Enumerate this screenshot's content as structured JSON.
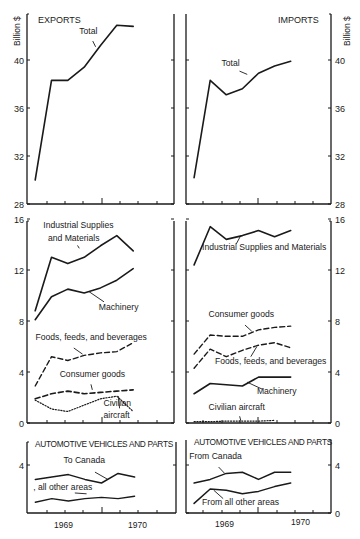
{
  "chart_data": [
    {
      "id": "exports-total",
      "type": "line",
      "panel_title": "EXPORTS",
      "ylabel": "Billion $",
      "ylim": [
        28,
        44
      ],
      "yticks": [
        28,
        32,
        36,
        40
      ],
      "x_range": [
        1968.5,
        1970.75
      ],
      "xtick_labels": [],
      "series": [
        {
          "name": "Total",
          "style": "solid",
          "width": 1.6,
          "x": [
            1968.625,
            1968.875,
            1969.125,
            1969.375,
            1969.625,
            1969.875,
            1970.125
          ],
          "y": [
            30.0,
            38.3,
            38.3,
            39.4,
            41.2,
            42.9,
            42.8
          ]
        }
      ],
      "annotations": [
        {
          "text": "Total",
          "x": 1969.3,
          "y": 42.2,
          "arrow_to": [
            1969.55,
            41.1
          ]
        }
      ]
    },
    {
      "id": "imports-total",
      "type": "line",
      "panel_title": "IMPORTS",
      "ylabel": "Billion $",
      "ylim": [
        28,
        44
      ],
      "yticks": [
        28,
        32,
        36,
        40
      ],
      "x_range": [
        1968.5,
        1970.75
      ],
      "xtick_labels": [],
      "series": [
        {
          "name": "Total",
          "style": "solid",
          "width": 1.6,
          "x": [
            1968.625,
            1968.875,
            1969.125,
            1969.375,
            1969.625,
            1969.875,
            1970.125
          ],
          "y": [
            30.2,
            38.3,
            37.1,
            37.6,
            38.9,
            39.5,
            39.9
          ]
        }
      ],
      "annotations": [
        {
          "text": "Total",
          "x": 1969.05,
          "y": 39.5,
          "arrow_to": [
            1969.45,
            38.8
          ]
        }
      ]
    },
    {
      "id": "exports-categories",
      "type": "line",
      "ylim": [
        0,
        16
      ],
      "yticks": [
        0,
        4,
        8,
        12,
        16
      ],
      "x_range": [
        1968.5,
        1970.75
      ],
      "series": [
        {
          "name": "Industrial Supplies and Materials",
          "style": "solid",
          "width": 1.6,
          "x": [
            1968.625,
            1968.875,
            1969.125,
            1969.375,
            1969.625,
            1969.875,
            1970.125
          ],
          "y": [
            8.8,
            13.0,
            12.5,
            13.0,
            13.9,
            14.7,
            13.5
          ]
        },
        {
          "name": "Machinery",
          "style": "solid",
          "width": 1.6,
          "x": [
            1968.625,
            1968.875,
            1969.125,
            1969.375,
            1969.625,
            1969.875,
            1970.125
          ],
          "y": [
            8.1,
            9.9,
            10.5,
            10.2,
            10.6,
            11.2,
            12.1
          ]
        },
        {
          "name": "Foods, feeds, and beverages",
          "style": "dashed",
          "width": 1.4,
          "x": [
            1968.625,
            1968.875,
            1969.125,
            1969.375,
            1969.625,
            1969.875,
            1970.125
          ],
          "y": [
            2.9,
            5.2,
            4.9,
            5.3,
            5.5,
            5.6,
            6.3
          ]
        },
        {
          "name": "Consumer goods",
          "style": "dashed",
          "width": 1.6,
          "x": [
            1968.625,
            1968.875,
            1969.125,
            1969.375,
            1969.625,
            1969.875,
            1970.125
          ],
          "y": [
            1.9,
            2.3,
            2.5,
            2.3,
            2.4,
            2.5,
            2.6
          ]
        },
        {
          "name": "Civilian aircraft",
          "style": "dotted",
          "width": 1.2,
          "x": [
            1968.625,
            1968.875,
            1969.125,
            1969.375,
            1969.625,
            1969.875,
            1970.125
          ],
          "y": [
            1.8,
            1.1,
            0.9,
            1.4,
            1.9,
            2.1,
            0.9
          ]
        }
      ],
      "annotations": [
        {
          "text": "Industrial Supplies",
          "x": 1968.75,
          "y": 15.3
        },
        {
          "text": "and Materials",
          "x": 1968.82,
          "y": 14.3,
          "arrow_to": [
            1969.3,
            13.7
          ]
        },
        {
          "text": "Machinery",
          "x": 1969.6,
          "y": 8.9,
          "arrow_to": [
            1969.45,
            10.3
          ]
        },
        {
          "text": "Foods, feeds, and beverages",
          "x": 1968.63,
          "y": 6.5,
          "arrow_to": [
            1969.35,
            5.4
          ]
        },
        {
          "text": "Consumer goods",
          "x": 1969.0,
          "y": 3.6,
          "arrow_to": [
            1969.5,
            2.6
          ]
        },
        {
          "text": "Civilian",
          "x": 1969.67,
          "y": 1.35
        },
        {
          "text": "aircraft",
          "x": 1969.67,
          "y": 0.4,
          "arrow_to": [
            1969.9,
            2.1
          ]
        }
      ]
    },
    {
      "id": "imports-categories",
      "type": "line",
      "ylim": [
        0,
        16
      ],
      "yticks": [
        0,
        4,
        8,
        12,
        16
      ],
      "x_range": [
        1968.5,
        1970.75
      ],
      "series": [
        {
          "name": "Industrial Supplies and Materials",
          "style": "solid",
          "width": 1.6,
          "x": [
            1968.625,
            1968.875,
            1969.125,
            1969.375,
            1969.625,
            1969.875,
            1970.125
          ],
          "y": [
            12.4,
            15.4,
            14.4,
            14.7,
            15.1,
            14.6,
            15.1
          ]
        },
        {
          "name": "Consumer goods",
          "style": "dashed",
          "width": 1.4,
          "x": [
            1968.625,
            1968.875,
            1969.125,
            1969.375,
            1969.625,
            1969.875,
            1970.125
          ],
          "y": [
            5.4,
            6.9,
            6.8,
            6.8,
            7.3,
            7.5,
            7.6
          ]
        },
        {
          "name": "Foods, feeds, and beverages",
          "style": "dashed",
          "width": 1.4,
          "x": [
            1968.625,
            1968.875,
            1969.125,
            1969.375,
            1969.625,
            1969.875,
            1970.125
          ],
          "y": [
            4.3,
            5.8,
            5.2,
            5.7,
            6.1,
            6.3,
            5.9
          ]
        },
        {
          "name": "Machinery",
          "style": "solid",
          "width": 1.6,
          "x": [
            1968.625,
            1968.875,
            1969.125,
            1969.375,
            1969.625,
            1969.875,
            1970.125
          ],
          "y": [
            2.3,
            3.1,
            3.0,
            2.9,
            3.6,
            3.6,
            3.6
          ]
        },
        {
          "name": "Civilian aircraft",
          "style": "dotted",
          "width": 1.2,
          "x": [
            1968.625,
            1968.875,
            1969.125,
            1969.375,
            1969.625,
            1969.875
          ],
          "y": [
            0.1,
            0.1,
            0.15,
            0.15,
            0.15,
            0.2
          ]
        }
      ],
      "annotations": [
        {
          "text": "Industrial Supplies and Materials",
          "x": 1968.75,
          "y": 13.6,
          "arrow_to": [
            1969.35,
            14.7
          ]
        },
        {
          "text": "Consumer goods",
          "x": 1968.85,
          "y": 8.3,
          "arrow_to": [
            1969.52,
            7.2
          ]
        },
        {
          "text": "Foods, feeds, and beverages",
          "x": 1968.95,
          "y": 4.6,
          "arrow_to": [
            1969.6,
            6.0
          ]
        },
        {
          "text": "Machinery",
          "x": 1969.6,
          "y": 2.3,
          "arrow_to": [
            1969.45,
            3.2
          ]
        },
        {
          "text": "Civilian aircraft",
          "x": 1968.85,
          "y": 1.0,
          "arrow_to": [
            1969.35,
            0.2
          ]
        }
      ]
    },
    {
      "id": "exports-automotive",
      "type": "line",
      "panel_title": "AUTOMOTIVE VEHICLES AND PARTS",
      "ylim": [
        0,
        5.5
      ],
      "yticks": [
        4
      ],
      "x_range": [
        1968.5,
        1970.75
      ],
      "xtick_labels": [
        "1969",
        "1970"
      ],
      "series": [
        {
          "name": "To Canada",
          "style": "solid",
          "width": 1.5,
          "x": [
            1968.625,
            1968.875,
            1969.125,
            1969.375,
            1969.625,
            1969.875,
            1970.125
          ],
          "y": [
            2.8,
            3.0,
            3.2,
            2.8,
            2.5,
            3.3,
            3.0
          ]
        },
        {
          "name": "all other areas",
          "style": "solid",
          "width": 1.4,
          "x": [
            1968.625,
            1968.875,
            1969.125,
            1969.375,
            1969.625,
            1969.875,
            1970.125
          ],
          "y": [
            0.9,
            1.2,
            1.0,
            1.2,
            1.3,
            1.2,
            1.4
          ]
        }
      ],
      "annotations": [
        {
          "text": "To Canada",
          "x": 1969.05,
          "y": 4.15,
          "arrow_to": [
            1969.72,
            2.8
          ]
        },
        {
          "text": "‚ all other areas",
          "x": 1968.6,
          "y": 1.9,
          "arrow_to": [
            1969.4,
            1.6
          ]
        }
      ]
    },
    {
      "id": "imports-automotive",
      "type": "line",
      "panel_title": "AUTOMOTIVE VEHICLES AND PARTS",
      "ylim": [
        0,
        5.5
      ],
      "yticks": [
        0,
        4
      ],
      "x_range": [
        1968.5,
        1970.75
      ],
      "xtick_labels": [
        "1969",
        "1970"
      ],
      "series": [
        {
          "name": "From Canada",
          "style": "solid",
          "width": 1.5,
          "x": [
            1968.625,
            1968.875,
            1969.125,
            1969.375,
            1969.625,
            1969.875,
            1970.125
          ],
          "y": [
            2.5,
            2.8,
            3.3,
            3.4,
            2.8,
            3.4,
            3.4
          ]
        },
        {
          "name": "From all other areas",
          "style": "solid",
          "width": 1.5,
          "x": [
            1968.625,
            1968.875,
            1969.125,
            1969.375,
            1969.625,
            1969.875,
            1970.125
          ],
          "y": [
            0.8,
            2.0,
            1.9,
            1.6,
            1.8,
            2.2,
            2.5
          ]
        }
      ],
      "annotations": [
        {
          "text": "From Canada",
          "x": 1968.55,
          "y": 4.5,
          "arrow_to": [
            1969.1,
            3.3
          ]
        },
        {
          "text": "From all other areas",
          "x": 1968.75,
          "y": 0.7,
          "arrow_to": [
            1968.93,
            1.9
          ]
        }
      ]
    }
  ],
  "labels": {
    "exports_title": "EXPORTS",
    "imports_title": "IMPORTS",
    "y_unit_left": "Billion $",
    "y_unit_right": "Billion $",
    "auto_title_left": "AUTOMOTIVE VEHICLES AND PARTS",
    "auto_title_right": "AUTOMOTIVE VEHICLES AND PARTS",
    "year_1969": "1969",
    "year_1970": "1970"
  }
}
